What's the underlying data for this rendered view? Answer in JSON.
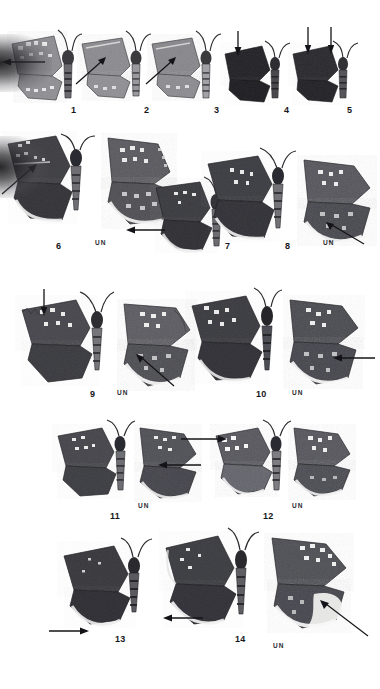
{
  "plate": {
    "title": "Butterfly specimen plate",
    "background_color": "#ffffff",
    "ink_color": "#16161a",
    "underside_label": "UN",
    "rows": [
      {
        "row_index": 1,
        "figures": [
          {
            "number": "1",
            "num_x": 73,
            "num_y": 113,
            "views": [
              "dorsal",
              "lateral"
            ],
            "un_label": null,
            "arrows": [
              "left-pointing into hindwing margin"
            ]
          },
          {
            "number": "2",
            "num_x": 146,
            "num_y": 113,
            "views": [
              "dorsal",
              "lateral"
            ],
            "un_label": null,
            "arrows": [
              "diagonal into forewing"
            ]
          },
          {
            "number": "3",
            "num_x": 216,
            "num_y": 113,
            "views": [
              "dorsal",
              "lateral"
            ],
            "un_label": null,
            "arrows": [
              "diagonal into forewing"
            ]
          },
          {
            "number": "4",
            "num_x": 286,
            "num_y": 113,
            "views": [
              "dorsal"
            ],
            "un_label": null,
            "arrows": [
              "vertical into forewing costa"
            ]
          },
          {
            "number": "5",
            "num_x": 349,
            "num_y": 113,
            "views": [
              "dorsal"
            ],
            "un_label": null,
            "arrows": [
              "two vertical into forewing"
            ]
          }
        ]
      },
      {
        "row_index": 2,
        "figures": [
          {
            "number": "6",
            "num_x": 58,
            "num_y": 248,
            "views": [
              "dorsal",
              "ventral"
            ],
            "un_label": "UN",
            "un_x": 97,
            "un_y": 244,
            "arrows": [
              "diagonal into forewing costa"
            ]
          },
          {
            "number": "7",
            "num_x": 227,
            "num_y": 248,
            "views": [
              "dorsal"
            ],
            "un_label": null,
            "arrows": [
              "left-pointing into hindwing"
            ]
          },
          {
            "number": "8",
            "num_x": 287,
            "num_y": 248,
            "views": [
              "dorsal",
              "ventral"
            ],
            "un_label": "UN",
            "un_x": 325,
            "un_y": 244,
            "arrows": [
              "vertical into forewing",
              "diagonal into hindwing margin"
            ]
          }
        ]
      },
      {
        "row_index": 3,
        "figures": [
          {
            "number": "9",
            "num_x": 92,
            "num_y": 396,
            "views": [
              "dorsal",
              "ventral"
            ],
            "un_label": "UN",
            "un_x": 119,
            "un_y": 393,
            "arrows": [
              "vertical into forewing",
              "diagonal into hindwing"
            ]
          },
          {
            "number": "10",
            "num_x": 259,
            "num_y": 396,
            "views": [
              "dorsal",
              "ventral"
            ],
            "un_label": "UN",
            "un_x": 294,
            "un_y": 393,
            "arrows": [
              "horizontal into hindwing"
            ]
          }
        ]
      },
      {
        "row_index": 4,
        "figures": [
          {
            "number": "11",
            "num_x": 113,
            "num_y": 516,
            "views": [
              "dorsal",
              "ventral"
            ],
            "un_label": "UN",
            "un_x": 139,
            "un_y": 504,
            "arrows": [
              "horizontal into hindwing"
            ]
          },
          {
            "number": "12",
            "num_x": 266,
            "num_y": 516,
            "views": [
              "dorsal",
              "ventral"
            ],
            "un_label": "UN",
            "un_x": 293,
            "un_y": 504,
            "arrows": [
              "horizontal into forewing"
            ]
          }
        ]
      },
      {
        "row_index": 5,
        "figures": [
          {
            "number": "13",
            "num_x": 118,
            "num_y": 641,
            "views": [
              "dorsal"
            ],
            "un_label": null,
            "arrows": [
              "horizontal into hindwing margin"
            ]
          },
          {
            "number": "14",
            "num_x": 238,
            "num_y": 641,
            "views": [
              "dorsal",
              "ventral"
            ],
            "un_label": "UN",
            "un_x": 275,
            "un_y": 645,
            "arrows": [
              "horizontal into hindwing margin",
              "diagonal into hindwing"
            ]
          }
        ]
      }
    ]
  }
}
